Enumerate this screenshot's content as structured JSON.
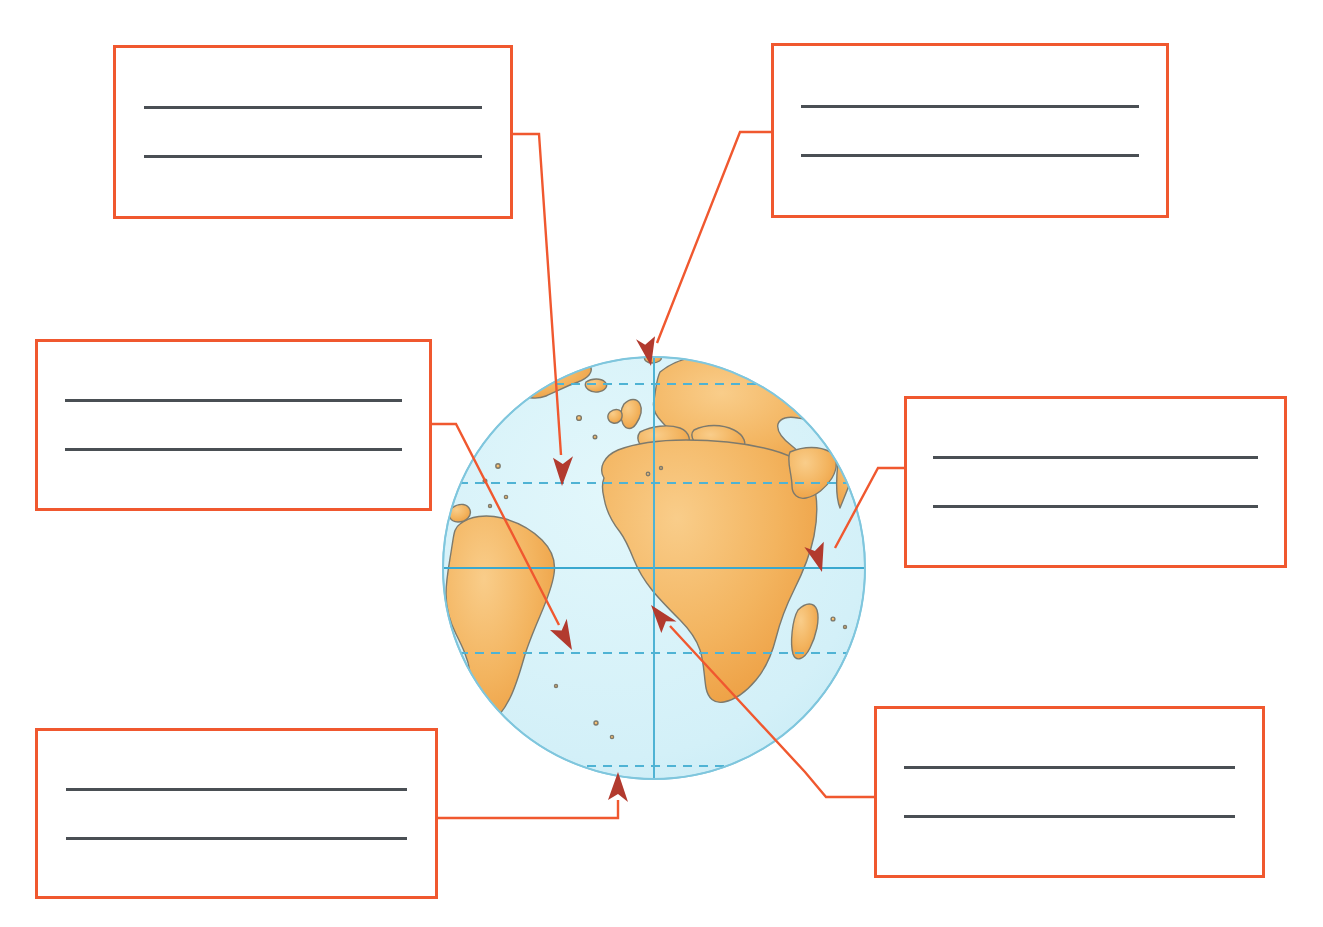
{
  "page": {
    "background_color": "#ffffff",
    "width": 1323,
    "height": 927
  },
  "palette": {
    "box_border": "#f0582f",
    "connector": "#f0582f",
    "arrowhead": "#b23a2e",
    "writing_line": "#4a4f54",
    "ocean": "#d5f2f8",
    "land": "#f3b45f",
    "land_edge": "#6b6b63",
    "graticule_solid": "#5bb8d8",
    "graticule_dashed": "#5bb8d8",
    "globe_outline": "#7fc6dd"
  },
  "globe": {
    "name": "earth-globe",
    "center_x": 654,
    "center_y": 568,
    "radius": 211,
    "view": "Atlantic / Africa / Europe / South America hemisphere",
    "features": [
      {
        "id": "arctic-circle",
        "label": "Arctic Circle",
        "style": "dashed",
        "y": 384
      },
      {
        "id": "tropic-of-cancer",
        "label": "Tropic of Cancer",
        "style": "dashed",
        "y": 483
      },
      {
        "id": "equator",
        "label": "Equator",
        "style": "solid",
        "y": 568
      },
      {
        "id": "tropic-of-capricorn",
        "label": "Tropic of Capricorn",
        "style": "dashed",
        "y": 653
      },
      {
        "id": "antarctic-circle",
        "label": "Antarctic Circle",
        "style": "dashed",
        "y": 766
      },
      {
        "id": "prime-meridian",
        "label": "Prime Meridian",
        "style": "solid",
        "x": 654
      }
    ]
  },
  "boxes": [
    {
      "id": "box-top-left",
      "name": "label-box-top-left",
      "x": 113,
      "y": 45,
      "w": 400,
      "h": 174,
      "answer_line_1": "",
      "answer_line_2": "",
      "lines": 2,
      "points_to": "tropic-of-cancer"
    },
    {
      "id": "box-top-right",
      "name": "label-box-top-right",
      "x": 771,
      "y": 43,
      "w": 398,
      "h": 175,
      "answer_line_1": "",
      "answer_line_2": "",
      "lines": 2,
      "points_to": "arctic-circle"
    },
    {
      "id": "box-mid-left",
      "name": "label-box-middle-left",
      "x": 35,
      "y": 339,
      "w": 397,
      "h": 172,
      "answer_line_1": "",
      "answer_line_2": "",
      "lines": 2,
      "points_to": "tropic-of-capricorn"
    },
    {
      "id": "box-mid-right",
      "name": "label-box-middle-right",
      "x": 904,
      "y": 396,
      "w": 383,
      "h": 172,
      "answer_line_1": "",
      "answer_line_2": "",
      "lines": 2,
      "points_to": "equator"
    },
    {
      "id": "box-bot-left",
      "name": "label-box-bottom-left",
      "x": 35,
      "y": 728,
      "w": 403,
      "h": 171,
      "answer_line_1": "",
      "answer_line_2": "",
      "lines": 2,
      "points_to": "antarctic-circle"
    },
    {
      "id": "box-bot-right",
      "name": "label-box-bottom-right",
      "x": 874,
      "y": 706,
      "w": 391,
      "h": 172,
      "answer_line_1": "",
      "answer_line_2": "",
      "lines": 2,
      "points_to": "south-atlantic-point"
    }
  ],
  "connectors": [
    {
      "id": "connector-top-left",
      "name": "connector-top-left-to-tropic-of-cancer",
      "path": "M 513 134 L 539 134 L 561 455",
      "arrow_tip": {
        "x": 562,
        "y": 483
      },
      "arrow_angle": 93
    },
    {
      "id": "connector-top-right",
      "name": "connector-top-right-to-arctic-circle",
      "path": "M 771 132 L 740 132 L 657 343",
      "arrow_tip": {
        "x": 651,
        "y": 362
      },
      "arrow_angle": 112
    },
    {
      "id": "connector-mid-left",
      "name": "connector-middle-left-to-tropic-of-capricorn",
      "path": "M 432 424 L 456 424 L 559 625",
      "arrow_tip": {
        "x": 571,
        "y": 648
      },
      "arrow_angle": 63
    },
    {
      "id": "connector-mid-right",
      "name": "connector-middle-right-to-equator",
      "path": "M 904 468 L 878 468 L 835 548",
      "arrow_tip": {
        "x": 823,
        "y": 570
      },
      "arrow_angle": 118
    },
    {
      "id": "connector-bot-left",
      "name": "connector-bottom-left-to-antarctic-circle",
      "path": "M 438 818 L 618 818 L 618 800",
      "arrow_tip": {
        "x": 618,
        "y": 776
      },
      "arrow_angle": -90
    },
    {
      "id": "connector-bot-right",
      "name": "connector-bottom-right-to-south-atlantic",
      "path": "M 874 797 L 826 797 L 805 772 L 670 626",
      "arrow_tip": {
        "x": 652,
        "y": 607
      },
      "arrow_angle": -133
    }
  ]
}
